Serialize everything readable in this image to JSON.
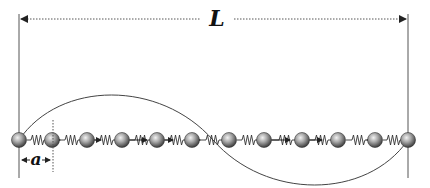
{
  "diagram": {
    "length_label": "L",
    "spacing_label": "a",
    "num_masses": 12,
    "num_springs": 11,
    "mode": "second harmonic (one full wavelength across L)",
    "colors": {
      "line": "#444444",
      "dotted": "#555555",
      "ball_light": "#e6e6e6",
      "ball_dark": "#4a4a4a",
      "spring": "#333333"
    },
    "mass_positions_x": [
      19,
      52,
      87,
      122,
      157,
      192,
      229,
      264,
      302,
      338,
      375,
      408
    ],
    "chain_y": 140,
    "wave": {
      "x_start": 19,
      "x_end": 408,
      "amplitude": 42,
      "cycles": 1
    }
  }
}
